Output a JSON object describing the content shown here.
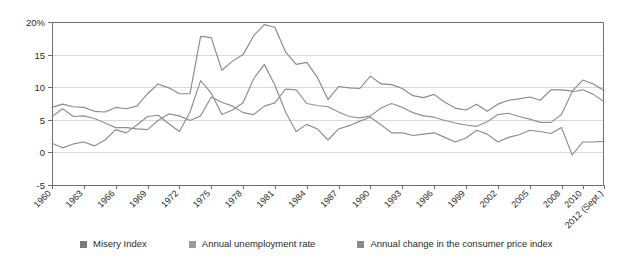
{
  "chart_data": {
    "type": "line",
    "title": "",
    "subtitle": "",
    "xlabel": "",
    "ylabel": "",
    "ylim": [
      -5,
      20
    ],
    "xlim": [
      1960,
      2012
    ],
    "grid": true,
    "legend_position": "bottom",
    "y_ticks": [
      "20%",
      "15",
      "10",
      "5",
      "0",
      "-5"
    ],
    "y_tick_values": [
      20,
      15,
      10,
      5,
      0,
      -5
    ],
    "x_tick_labels": [
      "1960",
      "1963",
      "1966",
      "1969",
      "1972",
      "1975",
      "1978",
      "1981",
      "1984",
      "1987",
      "1990",
      "1993",
      "1996",
      "1999",
      "2002",
      "2005",
      "2008",
      "2010",
      "2012 (Sept.)"
    ],
    "x_tick_values": [
      1960,
      1963,
      1966,
      1969,
      1972,
      1975,
      1978,
      1981,
      1984,
      1987,
      1990,
      1993,
      1996,
      1999,
      2002,
      2005,
      2008,
      2010,
      2012
    ],
    "x": [
      1960,
      1961,
      1962,
      1963,
      1964,
      1965,
      1966,
      1967,
      1968,
      1969,
      1970,
      1971,
      1972,
      1973,
      1974,
      1975,
      1976,
      1977,
      1978,
      1979,
      1980,
      1981,
      1982,
      1983,
      1984,
      1985,
      1986,
      1987,
      1988,
      1989,
      1990,
      1991,
      1992,
      1993,
      1994,
      1995,
      1996,
      1997,
      1998,
      1999,
      2000,
      2001,
      2002,
      2003,
      2004,
      2005,
      2006,
      2007,
      2008,
      2009,
      2010,
      2011,
      2012
    ],
    "series": [
      {
        "name": "Misery Index",
        "color": "#8a8a8a",
        "values": [
          6.9,
          7.4,
          7.0,
          6.9,
          6.3,
          6.2,
          6.9,
          6.7,
          7.1,
          9.0,
          10.5,
          9.9,
          9.0,
          9.0,
          17.8,
          17.6,
          12.6,
          14.0,
          15.0,
          17.9,
          19.6,
          19.2,
          15.4,
          13.5,
          13.8,
          11.5,
          8.1,
          10.1,
          9.9,
          9.8,
          11.7,
          10.5,
          10.4,
          9.8,
          8.7,
          8.4,
          8.9,
          7.7,
          6.8,
          6.5,
          7.4,
          6.3,
          7.4,
          8.0,
          8.2,
          8.5,
          8.0,
          9.6,
          9.6,
          9.4,
          11.1,
          10.5,
          9.5
        ]
      },
      {
        "name": "Annual unemployment rate",
        "color": "#909090",
        "values": [
          5.5,
          6.7,
          5.5,
          5.6,
          5.2,
          4.5,
          3.8,
          3.8,
          3.6,
          3.5,
          4.9,
          5.9,
          5.6,
          4.9,
          5.6,
          8.5,
          7.7,
          7.1,
          6.1,
          5.8,
          7.1,
          7.6,
          9.7,
          9.6,
          7.5,
          7.2,
          7.0,
          6.2,
          5.5,
          5.3,
          5.6,
          6.8,
          7.5,
          6.9,
          6.1,
          5.6,
          5.4,
          4.9,
          4.5,
          4.2,
          4.0,
          4.7,
          5.8,
          6.0,
          5.5,
          5.1,
          4.6,
          4.6,
          5.8,
          9.3,
          9.6,
          8.9,
          7.8
        ]
      },
      {
        "name": "Annual change in the consumer price index",
        "color": "#8d8d8d",
        "values": [
          1.4,
          0.7,
          1.3,
          1.6,
          1.0,
          1.9,
          3.5,
          3.0,
          4.2,
          5.5,
          5.7,
          4.4,
          3.2,
          6.2,
          11.0,
          9.1,
          5.8,
          6.5,
          7.6,
          11.3,
          13.5,
          10.3,
          6.2,
          3.2,
          4.3,
          3.6,
          1.9,
          3.6,
          4.1,
          4.8,
          5.4,
          4.2,
          3.0,
          3.0,
          2.6,
          2.8,
          3.0,
          2.3,
          1.6,
          2.2,
          3.4,
          2.8,
          1.6,
          2.3,
          2.7,
          3.4,
          3.2,
          2.9,
          3.8,
          -0.4,
          1.6,
          1.6,
          1.7
        ]
      }
    ]
  },
  "legend": {
    "items": [
      {
        "label": "Misery Index",
        "color": "#7a7a7a"
      },
      {
        "label": "Annual unemployment rate",
        "color": "#9a9a9a"
      },
      {
        "label": "Annual change in the consumer price index",
        "color": "#8a8a8a"
      }
    ]
  },
  "axes": {
    "y_axis_name": "percent",
    "x_axis_name": "year"
  }
}
